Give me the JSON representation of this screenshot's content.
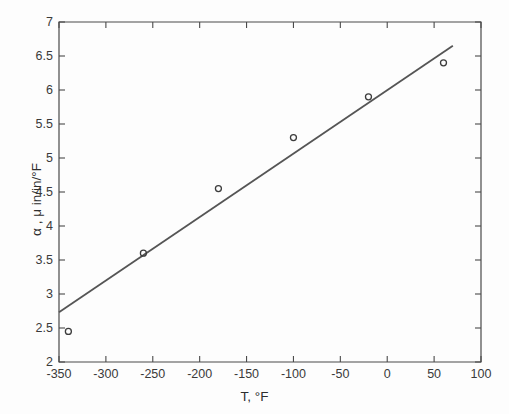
{
  "chart_data": {
    "type": "scatter",
    "title": "",
    "subtitle": "",
    "xlabel": "T, °F",
    "ylabel": "α , μ in/in/°F",
    "xlim": [
      -350,
      100
    ],
    "ylim": [
      2,
      7
    ],
    "xticks": [
      -350,
      -300,
      -250,
      -200,
      -150,
      -100,
      -50,
      0,
      50,
      100
    ],
    "xtick_labels": [
      "-350",
      "-300",
      "-250",
      "-200",
      "-150",
      "-100",
      "-50",
      "0",
      "50",
      "100"
    ],
    "yticks": [
      2,
      2.5,
      3,
      3.5,
      4,
      4.5,
      5,
      5.5,
      6,
      6.5,
      7
    ],
    "ytick_labels": [
      "2",
      "2.5",
      "3",
      "3.5",
      "4",
      "4.5",
      "5",
      "5.5",
      "6",
      "6.5",
      "7"
    ],
    "grid": false,
    "legend": null,
    "legend_position": "none",
    "marker": "open-circle",
    "marker_color": "#3c3c3c",
    "line_color": "#555555",
    "axis_color": "#4a4a4a",
    "background": "#ffffff",
    "series": [
      {
        "name": "data points",
        "type": "scatter",
        "x": [
          -340,
          -260,
          -180,
          -100,
          -20,
          60
        ],
        "y": [
          2.45,
          3.6,
          4.55,
          5.3,
          5.9,
          6.4
        ]
      },
      {
        "name": "regression line",
        "type": "line",
        "x": [
          -350,
          70
        ],
        "y": [
          2.73,
          6.65
        ]
      }
    ]
  },
  "axis_labels": {
    "x": "T, °F",
    "y": "α , μ in/in/°F"
  }
}
